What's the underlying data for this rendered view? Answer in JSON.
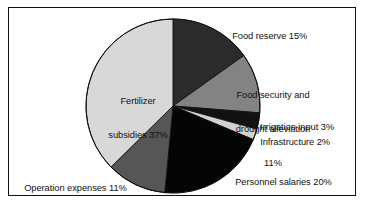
{
  "chart_data": {
    "type": "pie",
    "title": "",
    "subtitle": "",
    "xlabel": "",
    "ylabel": "",
    "legend_position": "none",
    "grid": false,
    "units": "percent",
    "start_angle_deg": 0,
    "direction": "clockwise",
    "center": {
      "x": 173,
      "y": 106
    },
    "radius": 87,
    "categories": [
      "Food reserve",
      "Food security and drought alleviation",
      "Irrigation input",
      "Infrastructure",
      "Personnel salaries",
      "Operation expenses",
      "Fertilizer subsidies"
    ],
    "values": [
      15,
      11,
      3,
      2,
      20,
      11,
      37
    ],
    "colors": [
      "#2b2b2b",
      "#838383",
      "#121212",
      "#d2d2d2",
      "#050505",
      "#565656",
      "#d8d8d8"
    ],
    "slices": [
      {
        "label": "Food reserve",
        "value": 15,
        "value_text": "15%",
        "label_text": "Food reserve 15%",
        "color": "#2b2b2b",
        "start_deg": 0,
        "end_deg": 54
      },
      {
        "label": "Food security and drought alleviation",
        "value": 11,
        "value_text": "11%",
        "label_line1": "Food security and",
        "label_line2": "drought alleviation",
        "label_line3": "11%",
        "color": "#838383",
        "start_deg": 54,
        "end_deg": 93.6
      },
      {
        "label": "Irrigation input",
        "value": 3,
        "value_text": "3%",
        "label_text": "Irrigation input 3%",
        "color": "#121212",
        "start_deg": 93.6,
        "end_deg": 104.4
      },
      {
        "label": "Infrastructure",
        "value": 2,
        "value_text": "2%",
        "label_text": "Infrastructure 2%",
        "color": "#d2d2d2",
        "start_deg": 104.4,
        "end_deg": 111.6
      },
      {
        "label": "Personnel salaries",
        "value": 20,
        "value_text": "20%",
        "label_text": "Personnel salaries 20%",
        "color": "#050505",
        "start_deg": 111.6,
        "end_deg": 183.6
      },
      {
        "label": "Operation expenses",
        "value": 11,
        "value_text": "11%",
        "label_text": "Operation expenses 11%",
        "color": "#565656",
        "start_deg": 183.6,
        "end_deg": 223.2
      },
      {
        "label": "Fertilizer subsidies",
        "value": 37,
        "value_text": "37%",
        "label_line1": "Fertilizer",
        "label_line2": "subsidies 37%",
        "color": "#d8d8d8",
        "start_deg": 223.2,
        "end_deg": 360
      }
    ]
  },
  "labels": {
    "food_reserve": "Food reserve 15%",
    "food_security_l1": "Food security and",
    "food_security_l2": "drought alleviation",
    "food_security_l3": "11%",
    "irrigation": "Irrigation input 3%",
    "infrastructure": "Infrastructure 2%",
    "personnel": "Personnel salaries 20%",
    "operation": "Operation expenses 11%",
    "fertilizer_l1": "Fertilizer",
    "fertilizer_l2": "subsidies 37%"
  },
  "style": {
    "background": "#ffffff",
    "border_color": "#111111",
    "text_color": "#111111",
    "slice_outline": "#111111"
  }
}
